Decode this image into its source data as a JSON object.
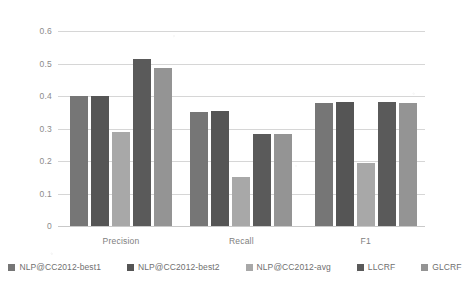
{
  "chart_data": {
    "type": "bar",
    "title": "",
    "subtitle": "",
    "xlabel": "",
    "ylabel": "",
    "categories": [
      "Precision",
      "Recall",
      "F1"
    ],
    "series": [
      {
        "name": "NLP@CC2012-best1",
        "color": "#767676",
        "values": [
          0.4,
          0.35,
          0.38
        ]
      },
      {
        "name": "NLP@CC2012-best2",
        "color": "#555555",
        "values": [
          0.4,
          0.355,
          0.383
        ]
      },
      {
        "name": "NLP@CC2012-avg",
        "color": "#a8a8a8",
        "values": [
          0.29,
          0.15,
          0.193
        ]
      },
      {
        "name": "LLCRF",
        "color": "#5a5a5a",
        "values": [
          0.515,
          0.283,
          0.383
        ]
      },
      {
        "name": "GLCRF",
        "color": "#949494",
        "values": [
          0.485,
          0.283,
          0.377
        ]
      }
    ],
    "ylim": [
      0,
      0.6
    ],
    "yticks": [
      "0",
      "0.1",
      "0.2",
      "0.3",
      "0.4",
      "0.5",
      "0.6"
    ],
    "ytick_values": [
      0,
      0.1,
      0.2,
      0.3,
      0.4,
      0.5,
      0.6
    ],
    "grid": true,
    "legend_position": "bottom",
    "bar_orientation": "vertical"
  }
}
